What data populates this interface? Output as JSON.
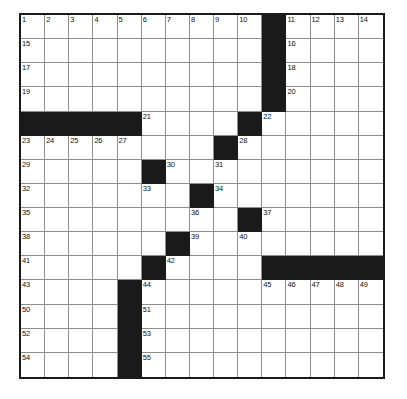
{
  "puzzle": {
    "title": "Crossword Grid",
    "rows": 15,
    "columns": 15,
    "background_color": "#ffffff",
    "block_color": "#1a1a1a",
    "grid_line_color": "#8d8d8d",
    "border_color": "#1a1a1a",
    "number_color": "#111111",
    "highest_clue_number": 55,
    "blocks": [
      [
        1,
        11
      ],
      [
        2,
        11
      ],
      [
        3,
        11
      ],
      [
        4,
        11
      ],
      [
        5,
        1
      ],
      [
        5,
        2
      ],
      [
        5,
        3
      ],
      [
        5,
        4
      ],
      [
        5,
        5
      ],
      [
        5,
        10
      ],
      [
        6,
        9
      ],
      [
        7,
        6
      ],
      [
        8,
        8
      ],
      [
        9,
        10
      ],
      [
        10,
        7
      ],
      [
        11,
        6
      ],
      [
        11,
        11
      ],
      [
        11,
        12
      ],
      [
        11,
        13
      ],
      [
        11,
        14
      ],
      [
        11,
        15
      ],
      [
        12,
        5
      ],
      [
        13,
        5
      ],
      [
        14,
        5
      ],
      [
        15,
        5
      ]
    ],
    "numbers": [
      {
        "row": 1,
        "col": 1,
        "n": "1"
      },
      {
        "row": 1,
        "col": 2,
        "n": "2"
      },
      {
        "row": 1,
        "col": 3,
        "n": "3"
      },
      {
        "row": 1,
        "col": 4,
        "n": "4"
      },
      {
        "row": 1,
        "col": 5,
        "n": "5"
      },
      {
        "row": 1,
        "col": 6,
        "n": "6"
      },
      {
        "row": 1,
        "col": 7,
        "n": "7"
      },
      {
        "row": 1,
        "col": 8,
        "n": "8"
      },
      {
        "row": 1,
        "col": 9,
        "n": "9"
      },
      {
        "row": 1,
        "col": 10,
        "n": "10"
      },
      {
        "row": 1,
        "col": 12,
        "n": "11"
      },
      {
        "row": 1,
        "col": 13,
        "n": "12"
      },
      {
        "row": 1,
        "col": 14,
        "n": "13"
      },
      {
        "row": 1,
        "col": 15,
        "n": "14"
      },
      {
        "row": 2,
        "col": 1,
        "n": "15"
      },
      {
        "row": 2,
        "col": 12,
        "n": "16"
      },
      {
        "row": 3,
        "col": 1,
        "n": "17"
      },
      {
        "row": 3,
        "col": 12,
        "n": "18"
      },
      {
        "row": 4,
        "col": 1,
        "n": "19"
      },
      {
        "row": 4,
        "col": 12,
        "n": "20"
      },
      {
        "row": 5,
        "col": 6,
        "n": "21"
      },
      {
        "row": 5,
        "col": 11,
        "n": "22"
      },
      {
        "row": 6,
        "col": 1,
        "n": "23"
      },
      {
        "row": 6,
        "col": 2,
        "n": "24"
      },
      {
        "row": 6,
        "col": 3,
        "n": "25"
      },
      {
        "row": 6,
        "col": 4,
        "n": "26"
      },
      {
        "row": 6,
        "col": 5,
        "n": "27"
      },
      {
        "row": 6,
        "col": 10,
        "n": "28"
      },
      {
        "row": 7,
        "col": 1,
        "n": "29"
      },
      {
        "row": 7,
        "col": 7,
        "n": "30"
      },
      {
        "row": 7,
        "col": 9,
        "n": "31"
      },
      {
        "row": 8,
        "col": 1,
        "n": "32"
      },
      {
        "row": 8,
        "col": 6,
        "n": "33"
      },
      {
        "row": 8,
        "col": 9,
        "n": "34"
      },
      {
        "row": 9,
        "col": 1,
        "n": "35"
      },
      {
        "row": 9,
        "col": 8,
        "n": "36"
      },
      {
        "row": 9,
        "col": 11,
        "n": "37"
      },
      {
        "row": 10,
        "col": 1,
        "n": "38"
      },
      {
        "row": 10,
        "col": 8,
        "n": "39"
      },
      {
        "row": 10,
        "col": 10,
        "n": "40"
      },
      {
        "row": 11,
        "col": 1,
        "n": "41"
      },
      {
        "row": 11,
        "col": 7,
        "n": "42"
      },
      {
        "row": 12,
        "col": 1,
        "n": "43"
      },
      {
        "row": 12,
        "col": 6,
        "n": "44"
      },
      {
        "row": 12,
        "col": 11,
        "n": "45"
      },
      {
        "row": 12,
        "col": 12,
        "n": "46"
      },
      {
        "row": 12,
        "col": 13,
        "n": "47"
      },
      {
        "row": 12,
        "col": 14,
        "n": "48"
      },
      {
        "row": 12,
        "col": 15,
        "n": "49"
      },
      {
        "row": 13,
        "col": 1,
        "n": "50"
      },
      {
        "row": 13,
        "col": 6,
        "n": "51"
      },
      {
        "row": 14,
        "col": 1,
        "n": "52"
      },
      {
        "row": 14,
        "col": 6,
        "n": "53"
      },
      {
        "row": 15,
        "col": 1,
        "n": "54"
      },
      {
        "row": 15,
        "col": 6,
        "n": "55"
      }
    ],
    "entries": []
  }
}
